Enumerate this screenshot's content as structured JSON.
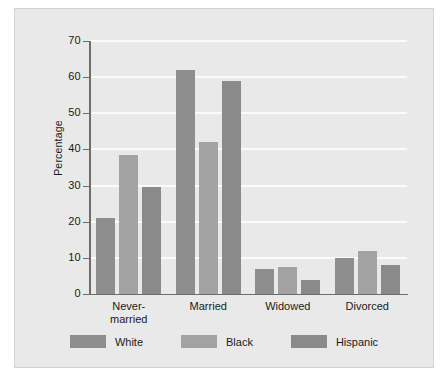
{
  "chart_data": {
    "type": "bar",
    "title": "",
    "subtitle": "",
    "xlabel": "",
    "ylabel": "Percentage",
    "categories": [
      "Never-married",
      "Married",
      "Widowed",
      "Divorced"
    ],
    "category_lines": [
      [
        "Never-",
        "married"
      ],
      [
        "Married"
      ],
      [
        "Widowed"
      ],
      [
        "Divorced"
      ]
    ],
    "series": [
      {
        "name": "White",
        "values": [
          21,
          62,
          7,
          10
        ],
        "color": "#8e8e8e"
      },
      {
        "name": "Black",
        "values": [
          38.5,
          42,
          7.5,
          12
        ],
        "color": "#a2a2a2"
      },
      {
        "name": "Hispanic",
        "values": [
          29.5,
          59,
          4,
          8
        ],
        "color": "#8a8a8a"
      }
    ],
    "ylim": [
      0,
      70
    ],
    "yticks": [
      0,
      10,
      20,
      30,
      40,
      50,
      60,
      70
    ],
    "ytick_labels": [
      "0",
      "10",
      "20",
      "30",
      "40",
      "50",
      "60",
      "70"
    ],
    "grid": true,
    "grid_color": "#fbfbfb",
    "legend_position": "bottom",
    "background": "#e9e9e9",
    "axis_color": "#6d6d6d",
    "text_color": "#1a1a1a"
  }
}
